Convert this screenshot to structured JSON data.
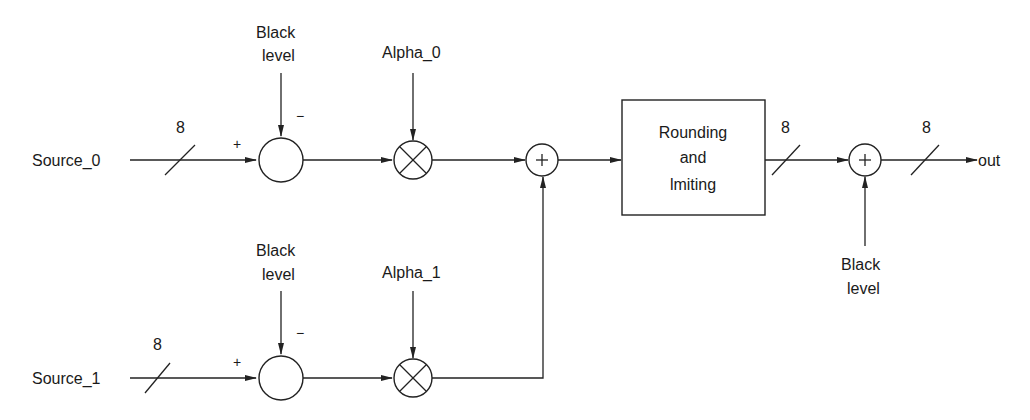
{
  "diagram": {
    "type": "block-diagram",
    "inputs": {
      "source_0": "Source_0",
      "source_1": "Source_1"
    },
    "bus_widths": {
      "source_0": "8",
      "source_1": "8",
      "after_rounding": "8",
      "output": "8"
    },
    "control_inputs": {
      "black_level_0": [
        "Black",
        "level"
      ],
      "black_level_1": [
        "Black",
        "level"
      ],
      "black_level_out": [
        "Black",
        "level"
      ],
      "alpha_0": "Alpha_0",
      "alpha_1": "Alpha_1"
    },
    "signs": {
      "plus": "+",
      "minus": "−"
    },
    "blocks": {
      "rounding": [
        "Rounding",
        "and",
        "lmiting"
      ]
    },
    "output": "out",
    "nodes": [
      {
        "id": "sub_0",
        "kind": "subtractor"
      },
      {
        "id": "mul_0",
        "kind": "multiplier"
      },
      {
        "id": "sub_1",
        "kind": "subtractor"
      },
      {
        "id": "mul_1",
        "kind": "multiplier"
      },
      {
        "id": "sum_mix",
        "kind": "adder"
      },
      {
        "id": "round_limit",
        "kind": "block"
      },
      {
        "id": "sum_out",
        "kind": "adder"
      }
    ],
    "colors": {
      "line": "#222222",
      "text": "#1a1a1a",
      "background": "#ffffff"
    }
  }
}
